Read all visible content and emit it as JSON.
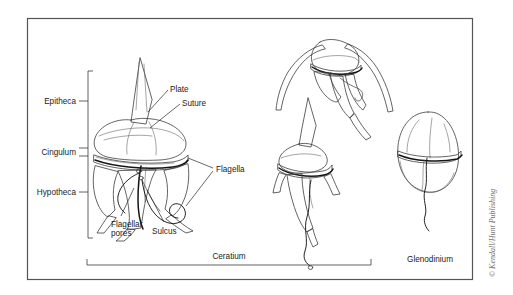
{
  "figure": {
    "frame": {
      "border_color": "#555555",
      "background": "#ffffff"
    },
    "labels": {
      "epitheca": "Epitheca",
      "cingulum": "Cingulum",
      "hypotheca": "Hypotheca",
      "plate": "Plate",
      "suture": "Suture",
      "flagella": "Flagella",
      "flagellar_pores_line1": "Flagellar",
      "flagellar_pores_line2": "pores",
      "sulcus": "Sulcus"
    },
    "genus_labels": {
      "ceratium": "Ceratium",
      "glenodinium": "Glenodinium"
    },
    "credit": "© Kendall/Hunt Publishing",
    "colors": {
      "outline": "#3c3c3c",
      "cingulum_band": "#141414",
      "label_text": "#1b1b1b",
      "credit_text": "#6e6e6e",
      "shade_light": "#e8e8e8",
      "shade_mid": "#b9b9b9",
      "shade_dark": "#8a8a8a"
    },
    "specimens": [
      {
        "name": "ceratium-main-cutaway",
        "genus": "Ceratium",
        "view": "cutaway-front"
      },
      {
        "name": "ceratium-upper",
        "genus": "Ceratium",
        "view": "lateral-horned"
      },
      {
        "name": "ceratium-lower",
        "genus": "Ceratium",
        "view": "ventral"
      },
      {
        "name": "glenodinium-cell",
        "genus": "Glenodinium",
        "view": "ventral-oval"
      }
    ]
  }
}
